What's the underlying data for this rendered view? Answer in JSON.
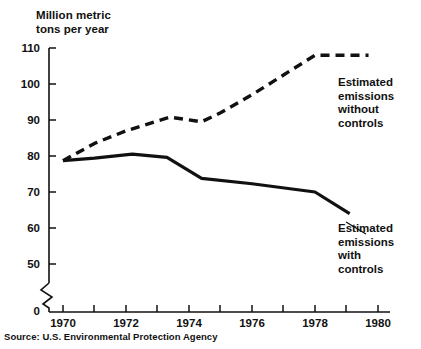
{
  "chart_data": {
    "type": "line",
    "title": "",
    "ylabel": "Million metric\ntons per year",
    "xlabel": "",
    "ylim": [
      0,
      110
    ],
    "xlim": [
      1969.6,
      1980
    ],
    "grid": false,
    "legend_position": "inline-annotations",
    "axis_break": {
      "present": true,
      "between": [
        0,
        50
      ],
      "note": "zigzag break on the value axis between 0 and 50"
    },
    "y_ticks": [
      0,
      50,
      60,
      70,
      80,
      90,
      100,
      110
    ],
    "y_tick_labels": [
      "0",
      "50",
      "60",
      "70",
      "80",
      "90",
      "100",
      "110"
    ],
    "x_ticks": [
      1970,
      1971,
      1972,
      1973,
      1974,
      1975,
      1976,
      1977,
      1978,
      1979,
      1980
    ],
    "x_tick_labels": [
      "1970",
      "",
      "1972",
      "",
      "1974",
      "",
      "1976",
      "",
      "1978",
      "",
      "1980"
    ],
    "x_labeled_ticks": [
      "1970",
      "1972",
      "1974",
      "1976",
      "1978",
      "1980"
    ],
    "series": [
      {
        "name": "Estimated emissions without controls",
        "style": "dashed",
        "annotation": "Estimated\nemissions\nwithout\ncontrols",
        "x": [
          1970.0,
          1971.0,
          1972.0,
          1973.4,
          1974.4,
          1975.0,
          1976.0,
          1977.0,
          1978.0,
          1979.7
        ],
        "values": [
          78.7,
          83.5,
          87.0,
          90.8,
          89.5,
          92.0,
          97.0,
          102.5,
          108.0,
          108.0
        ]
      },
      {
        "name": "Estimated emissions with controls",
        "style": "solid",
        "annotation": "Estimated\nemissions\nwith\ncontrols",
        "x": [
          1970.0,
          1971.0,
          1972.2,
          1973.3,
          1974.4,
          1976.0,
          1978.0,
          1979.1
        ],
        "values": [
          78.7,
          79.4,
          80.5,
          79.6,
          73.8,
          72.3,
          70.0,
          64.0
        ]
      }
    ]
  },
  "axis": {
    "y_title": "Million metric\ntons per year",
    "y_tick_labels": [
      "110",
      "100",
      "90",
      "80",
      "70",
      "60",
      "50",
      "0"
    ],
    "x_tick_labels": [
      "1970",
      "1972",
      "1974",
      "1976",
      "1978",
      "1980"
    ]
  },
  "annotations": {
    "without_controls": "Estimated\nemissions\nwithout\ncontrols",
    "with_controls": "Estimated\nemissions\nwith\ncontrols"
  },
  "source": {
    "text": "Source: U.S. Environmental Protection Agency"
  },
  "colors": {
    "ink": "#111111",
    "background": "#ffffff"
  }
}
